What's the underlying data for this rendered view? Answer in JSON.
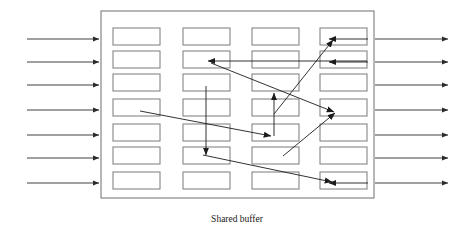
{
  "figure": {
    "caption": "Shared buffer",
    "caption_x": 237,
    "caption_y": 222,
    "frame": {
      "x": 101,
      "y": 11,
      "width": 273,
      "height": 187
    },
    "colors": {
      "frame_stroke": "#6f6f6f",
      "slot_stroke": "#7a7a7a",
      "slot_fill": "#ffffff",
      "arrow_stroke": "#1c1c1c",
      "io_arrow_stroke": "#2b2b2b",
      "background": "#ffffff"
    },
    "grid": {
      "columns": 4,
      "rows": 7,
      "slot_width": 47,
      "slot_height": 17,
      "column_x": [
        113,
        183,
        252,
        320
      ],
      "row_y": [
        28,
        51,
        74,
        99,
        124,
        147,
        172
      ]
    },
    "slots": [
      {
        "id": "slot-c1-r1",
        "col": 1,
        "row": 1,
        "x": 113,
        "y": 28
      },
      {
        "id": "slot-c1-r2",
        "col": 1,
        "row": 2,
        "x": 113,
        "y": 51
      },
      {
        "id": "slot-c1-r3",
        "col": 1,
        "row": 3,
        "x": 113,
        "y": 74
      },
      {
        "id": "slot-c1-r4",
        "col": 1,
        "row": 4,
        "x": 113,
        "y": 99
      },
      {
        "id": "slot-c1-r5",
        "col": 1,
        "row": 5,
        "x": 113,
        "y": 124
      },
      {
        "id": "slot-c1-r6",
        "col": 1,
        "row": 6,
        "x": 113,
        "y": 147
      },
      {
        "id": "slot-c1-r7",
        "col": 1,
        "row": 7,
        "x": 113,
        "y": 172
      },
      {
        "id": "slot-c2-r1",
        "col": 2,
        "row": 1,
        "x": 183,
        "y": 28
      },
      {
        "id": "slot-c2-r2",
        "col": 2,
        "row": 2,
        "x": 183,
        "y": 51
      },
      {
        "id": "slot-c2-r3",
        "col": 2,
        "row": 3,
        "x": 183,
        "y": 74
      },
      {
        "id": "slot-c2-r4",
        "col": 2,
        "row": 4,
        "x": 183,
        "y": 99
      },
      {
        "id": "slot-c2-r5",
        "col": 2,
        "row": 5,
        "x": 183,
        "y": 124
      },
      {
        "id": "slot-c2-r6",
        "col": 2,
        "row": 6,
        "x": 183,
        "y": 147
      },
      {
        "id": "slot-c2-r7",
        "col": 2,
        "row": 7,
        "x": 183,
        "y": 172
      },
      {
        "id": "slot-c3-r1",
        "col": 3,
        "row": 1,
        "x": 252,
        "y": 28
      },
      {
        "id": "slot-c3-r2",
        "col": 3,
        "row": 2,
        "x": 252,
        "y": 51
      },
      {
        "id": "slot-c3-r3",
        "col": 3,
        "row": 3,
        "x": 252,
        "y": 74
      },
      {
        "id": "slot-c3-r4",
        "col": 3,
        "row": 4,
        "x": 252,
        "y": 99
      },
      {
        "id": "slot-c3-r5",
        "col": 3,
        "row": 5,
        "x": 252,
        "y": 124
      },
      {
        "id": "slot-c3-r6",
        "col": 3,
        "row": 6,
        "x": 252,
        "y": 147
      },
      {
        "id": "slot-c3-r7",
        "col": 3,
        "row": 7,
        "x": 252,
        "y": 172
      },
      {
        "id": "slot-c4-r1",
        "col": 4,
        "row": 1,
        "x": 320,
        "y": 28
      },
      {
        "id": "slot-c4-r2",
        "col": 4,
        "row": 2,
        "x": 320,
        "y": 51
      },
      {
        "id": "slot-c4-r3",
        "col": 4,
        "row": 3,
        "x": 320,
        "y": 74
      },
      {
        "id": "slot-c4-r4",
        "col": 4,
        "row": 4,
        "x": 320,
        "y": 99
      },
      {
        "id": "slot-c4-r5",
        "col": 4,
        "row": 5,
        "x": 320,
        "y": 124
      },
      {
        "id": "slot-c4-r6",
        "col": 4,
        "row": 6,
        "x": 320,
        "y": 147
      },
      {
        "id": "slot-c4-r7",
        "col": 4,
        "row": 7,
        "x": 320,
        "y": 172
      }
    ],
    "input_arrows": [
      {
        "id": "input-arrow-1",
        "x1": 27,
        "y1": 39,
        "x2": 99,
        "y2": 39
      },
      {
        "id": "input-arrow-2",
        "x1": 27,
        "y1": 62,
        "x2": 99,
        "y2": 62
      },
      {
        "id": "input-arrow-3",
        "x1": 27,
        "y1": 85,
        "x2": 99,
        "y2": 85
      },
      {
        "id": "input-arrow-4",
        "x1": 27,
        "y1": 110,
        "x2": 99,
        "y2": 110
      },
      {
        "id": "input-arrow-5",
        "x1": 27,
        "y1": 135,
        "x2": 99,
        "y2": 135
      },
      {
        "id": "input-arrow-6",
        "x1": 27,
        "y1": 158,
        "x2": 99,
        "y2": 158
      },
      {
        "id": "input-arrow-7",
        "x1": 27,
        "y1": 183,
        "x2": 99,
        "y2": 183
      }
    ],
    "output_arrows": [
      {
        "id": "output-arrow-1",
        "x1": 375,
        "y1": 39,
        "x2": 448,
        "y2": 39
      },
      {
        "id": "output-arrow-2",
        "x1": 375,
        "y1": 62,
        "x2": 448,
        "y2": 62
      },
      {
        "id": "output-arrow-3",
        "x1": 375,
        "y1": 85,
        "x2": 448,
        "y2": 85
      },
      {
        "id": "output-arrow-4",
        "x1": 375,
        "y1": 110,
        "x2": 448,
        "y2": 110
      },
      {
        "id": "output-arrow-5",
        "x1": 375,
        "y1": 135,
        "x2": 448,
        "y2": 135
      },
      {
        "id": "output-arrow-6",
        "x1": 375,
        "y1": 158,
        "x2": 448,
        "y2": 158
      },
      {
        "id": "output-arrow-7",
        "x1": 375,
        "y1": 183,
        "x2": 448,
        "y2": 183
      }
    ],
    "tail_arrows": [
      {
        "id": "tail-arrow-r1",
        "x1": 368,
        "y1": 39,
        "x2": 329,
        "y2": 39
      },
      {
        "id": "tail-arrow-r2",
        "x1": 368,
        "y1": 62,
        "x2": 329,
        "y2": 62
      },
      {
        "id": "tail-arrow-r7",
        "x1": 368,
        "y1": 183,
        "x2": 329,
        "y2": 183
      }
    ],
    "internal_arrows": [
      {
        "id": "internal-arrow-a",
        "from": "slot-c4-r2-right",
        "to": "slot-c2-r2",
        "x1": 367,
        "y1": 61,
        "x2": 208,
        "y2": 61
      },
      {
        "id": "internal-arrow-b",
        "from": "slot-c3-r4",
        "to": "slot-c4-r1",
        "x1": 274,
        "y1": 114,
        "x2": 333,
        "y2": 40
      },
      {
        "id": "internal-arrow-c",
        "from": "slot-c2-r2",
        "to": "slot-c4-r4",
        "x1": 211,
        "y1": 63,
        "x2": 334,
        "y2": 112
      },
      {
        "id": "internal-arrow-d",
        "from": "slot-c2-r3",
        "to": "slot-c2-r6",
        "x1": 206,
        "y1": 86,
        "x2": 206,
        "y2": 155
      },
      {
        "id": "internal-arrow-e",
        "from": "slot-c3-r5",
        "to": "slot-c3-r3",
        "x1": 274,
        "y1": 136,
        "x2": 274,
        "y2": 93
      },
      {
        "id": "internal-arrow-f",
        "from": "slot-c1-r4",
        "to": "slot-c3-r5",
        "x1": 140,
        "y1": 111,
        "x2": 271,
        "y2": 136
      },
      {
        "id": "internal-arrow-g",
        "from": "slot-c2-r6",
        "to": "slot-c4-r7",
        "x1": 203,
        "y1": 155,
        "x2": 332,
        "y2": 182
      },
      {
        "id": "internal-arrow-h",
        "from": "slot-c3-r6",
        "to": "slot-c4-r4",
        "x1": 283,
        "y1": 156,
        "x2": 335,
        "y2": 113
      }
    ]
  }
}
